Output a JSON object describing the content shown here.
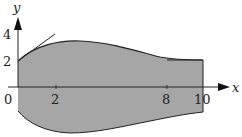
{
  "figure": {
    "axes": {
      "x_label": "x",
      "y_label": "y",
      "origin_label": "0",
      "x_ticks": [
        "2",
        "8",
        "10"
      ],
      "y_ticks": [
        "2",
        "4"
      ]
    },
    "region": {
      "description": "Shaded region between an upper curve and a lower curve from x=0 to x=10",
      "fill_color": "#a6a6a6",
      "stroke_color": "#222222",
      "upper_curve_points": [
        [
          0,
          2
        ],
        [
          2,
          3.3
        ],
        [
          4,
          3.6
        ],
        [
          6,
          3.2
        ],
        [
          8,
          2.15
        ],
        [
          10,
          2.0
        ]
      ],
      "lower_curve_points": [
        [
          0,
          -1.4
        ],
        [
          2,
          -2.1
        ],
        [
          4,
          -2.3
        ],
        [
          6,
          -2.2
        ],
        [
          8,
          -1.9
        ],
        [
          10,
          -1.8
        ]
      ]
    },
    "annotations": {
      "tangent_at_x0": "Tangent line to upper curve at (0,2)",
      "tangent_at_x10": "Horizontal tangent line near x=8..10 at y=2"
    }
  }
}
